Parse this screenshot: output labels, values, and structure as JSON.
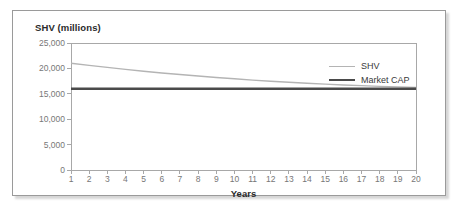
{
  "chart_data": {
    "type": "line",
    "title": "SHV (millions)",
    "xlabel": "Years",
    "ylabel": "SHV (millions)",
    "xlim": [
      1,
      20
    ],
    "ylim": [
      0,
      25000
    ],
    "grid": false,
    "legend_position": "top-right",
    "x": [
      1,
      2,
      3,
      4,
      5,
      6,
      7,
      8,
      9,
      10,
      11,
      12,
      13,
      14,
      15,
      16,
      17,
      18,
      19,
      20
    ],
    "x_tick_labels": [
      "1",
      "2",
      "3",
      "4",
      "5",
      "6",
      "7",
      "8",
      "9",
      "10",
      "11",
      "12",
      "13",
      "14",
      "15",
      "16",
      "17",
      "18",
      "19",
      "20"
    ],
    "y_tick_values": [
      0,
      5000,
      10000,
      15000,
      20000,
      25000
    ],
    "y_tick_labels": [
      "0",
      "5,000",
      "10,000",
      "15,000",
      "20,000",
      "25,000"
    ],
    "series": [
      {
        "name": "SHV",
        "color": "#b4b4b4",
        "width": 1.4,
        "values": [
          21000,
          20600,
          20200,
          19800,
          19450,
          19100,
          18800,
          18500,
          18200,
          17950,
          17700,
          17480,
          17270,
          17080,
          16900,
          16740,
          16600,
          16470,
          16360,
          16260
        ]
      },
      {
        "name": "Market CAP",
        "color": "#4a4a4a",
        "width": 2.4,
        "values": [
          16000,
          16000,
          16000,
          16000,
          16000,
          16000,
          16000,
          16000,
          16000,
          16000,
          16000,
          16000,
          16000,
          16000,
          16000,
          16000,
          16000,
          16000,
          16000,
          16000
        ]
      }
    ],
    "legend": [
      {
        "label": "SHV",
        "color": "#b4b4b4",
        "width": 1.4
      },
      {
        "label": "Market CAP",
        "color": "#4a4a4a",
        "width": 2.4
      }
    ],
    "axis_color": "#a8a8a8",
    "frame_color": "#9a9a9a",
    "tick_text_color": "#777777",
    "title_text_color": "#2b2b2b"
  }
}
